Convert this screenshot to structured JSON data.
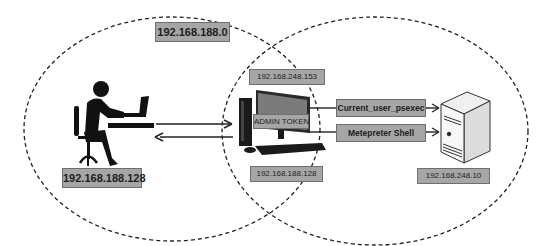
{
  "diagram": {
    "networks": [
      {
        "name": "left-network",
        "label": "192.168.188.0"
      },
      {
        "name": "right-network",
        "label": ""
      }
    ],
    "nodes": {
      "attacker": {
        "icon": "person-at-laptop-icon",
        "ip": "192.168.188.128"
      },
      "pivot": {
        "icon": "desktop-computer-icon",
        "ip_top": "192.168.248.153",
        "ip_bottom": "192.168.188.128",
        "token_label": "ADMIN TOKEN"
      },
      "target": {
        "icon": "server-tower-icon",
        "ip": "192.168.248.10"
      }
    },
    "edges": [
      {
        "from": "attacker",
        "to": "pivot",
        "label": ""
      },
      {
        "from": "pivot",
        "to": "attacker",
        "label": ""
      },
      {
        "from": "pivot",
        "to": "target",
        "label": "Current_user_psexec"
      },
      {
        "from": "pivot",
        "to": "target",
        "label": "Metepreter Shell"
      }
    ],
    "colors": {
      "label_fill": "#a6a6a6",
      "label_border": "#6e6e6e",
      "line": "#222222",
      "dash": "#222222"
    }
  }
}
